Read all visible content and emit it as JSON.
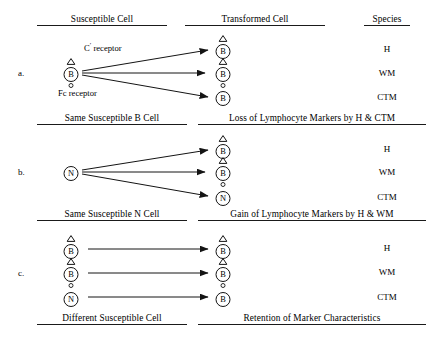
{
  "figure": {
    "species_column_header": "Species",
    "panels": [
      {
        "letter": "a.",
        "left_header": "Susceptible Cell",
        "right_header": "Transformed Cell",
        "source_cells": [
          {
            "label": "B",
            "has_c_receptor": true,
            "has_fc_receptor": true
          }
        ],
        "annotations": [
          {
            "name": "c-receptor-label",
            "text": "C' receptor"
          },
          {
            "name": "fc-receptor-label",
            "text": "Fc receptor"
          }
        ],
        "rows": [
          {
            "species": "H",
            "transformed": {
              "label": "B",
              "has_c_receptor": true,
              "has_fc_receptor": false
            }
          },
          {
            "species": "WM",
            "transformed": {
              "label": "B",
              "has_c_receptor": true,
              "has_fc_receptor": true
            }
          },
          {
            "species": "CTM",
            "transformed": {
              "label": "B",
              "has_c_receptor": false,
              "has_fc_receptor": false
            }
          }
        ]
      },
      {
        "letter": "b.",
        "left_header": "Same Susceptible B Cell",
        "right_header": "Loss of Lymphocyte Markers by H & CTM",
        "source_cells": [
          {
            "label": "N",
            "has_c_receptor": false,
            "has_fc_receptor": false
          }
        ],
        "annotations": [],
        "rows": [
          {
            "species": "H",
            "transformed": {
              "label": "B",
              "has_c_receptor": true,
              "has_fc_receptor": false
            }
          },
          {
            "species": "WM",
            "transformed": {
              "label": "B",
              "has_c_receptor": true,
              "has_fc_receptor": true
            }
          },
          {
            "species": "CTM",
            "transformed": {
              "label": "N",
              "has_c_receptor": false,
              "has_fc_receptor": false
            }
          }
        ]
      },
      {
        "letter": "c.",
        "left_header": "Same Susceptible N Cell",
        "right_header": "Gain of Lymphocyte Markers by H & WM",
        "source_cells": [
          {
            "label": "B",
            "has_c_receptor": true,
            "has_fc_receptor": false
          },
          {
            "label": "B",
            "has_c_receptor": true,
            "has_fc_receptor": true
          },
          {
            "label": "N",
            "has_c_receptor": false,
            "has_fc_receptor": false
          }
        ],
        "annotations": [],
        "rows": [
          {
            "species": "H",
            "transformed": {
              "label": "B",
              "has_c_receptor": true,
              "has_fc_receptor": false
            }
          },
          {
            "species": "WM",
            "transformed": {
              "label": "B",
              "has_c_receptor": true,
              "has_fc_receptor": true
            }
          },
          {
            "species": "CTM",
            "transformed": {
              "label": "B",
              "has_c_receptor": false,
              "has_fc_receptor": false
            }
          }
        ]
      }
    ],
    "footer": {
      "left": "Different Susceptible Cell",
      "right": "Retention of Marker Characteristics"
    },
    "colors": {
      "ink": "#141414",
      "rule": "#1a1a1a",
      "background": "#ffffff"
    }
  }
}
